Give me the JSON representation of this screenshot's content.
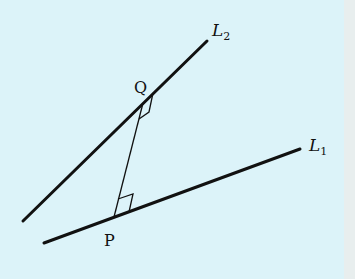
{
  "diagram": {
    "colors": {
      "background": "#dcf3f9",
      "right_strip": "#e8eeee",
      "ink": "#111111"
    },
    "lines": [
      {
        "name": "L2",
        "label": "L",
        "subscript": "2",
        "x1": 23,
        "y1": 221,
        "x2": 207,
        "y2": 41
      },
      {
        "name": "L1",
        "label": "L",
        "subscript": "1",
        "x1": 44,
        "y1": 243,
        "x2": 300,
        "y2": 149
      }
    ],
    "points": [
      {
        "name": "Q",
        "label": "Q",
        "x": 143,
        "y": 103
      },
      {
        "name": "P",
        "label": "P",
        "x": 114,
        "y": 217
      }
    ],
    "segment": {
      "from": "P",
      "to": "Q",
      "note": "common perpendicular"
    },
    "right_angle_marks": [
      "at Q on L2",
      "at P on L1"
    ]
  }
}
